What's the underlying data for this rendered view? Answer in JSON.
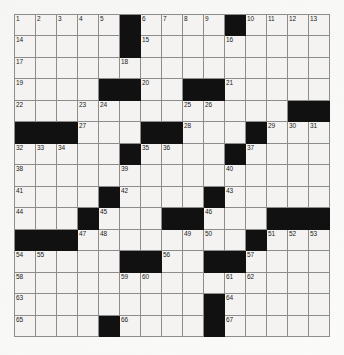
{
  "puzzle": {
    "type": "crossword-grid",
    "title": "Crossword Puzzle Grid",
    "rows": 15,
    "columns": 15,
    "colors": {
      "block": "#111111",
      "cell": "#f4f3f1",
      "grid_line": "#8d8d8d",
      "number_text": "#1b1b1b",
      "page_background": "#fbfbfa"
    },
    "black_squares": [
      [
        1,
        6
      ],
      [
        1,
        11
      ],
      [
        2,
        6
      ],
      [
        4,
        5
      ],
      [
        4,
        6
      ],
      [
        4,
        9
      ],
      [
        4,
        10
      ],
      [
        5,
        14
      ],
      [
        5,
        15
      ],
      [
        6,
        1
      ],
      [
        6,
        2
      ],
      [
        6,
        3
      ],
      [
        6,
        7
      ],
      [
        6,
        8
      ],
      [
        6,
        12
      ],
      [
        7,
        6
      ],
      [
        7,
        11
      ],
      [
        9,
        5
      ],
      [
        9,
        10
      ],
      [
        10,
        4
      ],
      [
        10,
        8
      ],
      [
        10,
        9
      ],
      [
        10,
        13
      ],
      [
        10,
        14
      ],
      [
        10,
        15
      ],
      [
        11,
        1
      ],
      [
        11,
        2
      ],
      [
        11,
        3
      ],
      [
        11,
        12
      ],
      [
        12,
        6
      ],
      [
        12,
        7
      ],
      [
        12,
        10
      ],
      [
        12,
        11
      ],
      [
        14,
        10
      ],
      [
        15,
        5
      ],
      [
        15,
        10
      ]
    ],
    "numbers": [
      {
        "row": 1,
        "col": 1,
        "n": "1"
      },
      {
        "row": 1,
        "col": 2,
        "n": "2"
      },
      {
        "row": 1,
        "col": 3,
        "n": "3"
      },
      {
        "row": 1,
        "col": 4,
        "n": "4"
      },
      {
        "row": 1,
        "col": 5,
        "n": "5"
      },
      {
        "row": 1,
        "col": 7,
        "n": "6"
      },
      {
        "row": 1,
        "col": 8,
        "n": "7"
      },
      {
        "row": 1,
        "col": 9,
        "n": "8"
      },
      {
        "row": 1,
        "col": 10,
        "n": "9"
      },
      {
        "row": 1,
        "col": 12,
        "n": "10"
      },
      {
        "row": 1,
        "col": 13,
        "n": "11"
      },
      {
        "row": 1,
        "col": 14,
        "n": "12"
      },
      {
        "row": 1,
        "col": 15,
        "n": "13"
      },
      {
        "row": 2,
        "col": 1,
        "n": "14"
      },
      {
        "row": 2,
        "col": 7,
        "n": "15"
      },
      {
        "row": 2,
        "col": 11,
        "n": "16"
      },
      {
        "row": 3,
        "col": 1,
        "n": "17"
      },
      {
        "row": 3,
        "col": 6,
        "n": "18"
      },
      {
        "row": 4,
        "col": 1,
        "n": "19"
      },
      {
        "row": 4,
        "col": 7,
        "n": "20"
      },
      {
        "row": 4,
        "col": 11,
        "n": "21"
      },
      {
        "row": 5,
        "col": 1,
        "n": "22"
      },
      {
        "row": 5,
        "col": 4,
        "n": "23"
      },
      {
        "row": 5,
        "col": 5,
        "n": "24"
      },
      {
        "row": 5,
        "col": 9,
        "n": "25"
      },
      {
        "row": 5,
        "col": 10,
        "n": "26"
      },
      {
        "row": 6,
        "col": 4,
        "n": "27"
      },
      {
        "row": 6,
        "col": 9,
        "n": "28"
      },
      {
        "row": 6,
        "col": 13,
        "n": "29"
      },
      {
        "row": 6,
        "col": 14,
        "n": "30"
      },
      {
        "row": 6,
        "col": 15,
        "n": "31"
      },
      {
        "row": 7,
        "col": 1,
        "n": "32"
      },
      {
        "row": 7,
        "col": 2,
        "n": "33"
      },
      {
        "row": 7,
        "col": 3,
        "n": "34"
      },
      {
        "row": 7,
        "col": 7,
        "n": "35"
      },
      {
        "row": 7,
        "col": 8,
        "n": "36"
      },
      {
        "row": 7,
        "col": 12,
        "n": "37"
      },
      {
        "row": 8,
        "col": 1,
        "n": "38"
      },
      {
        "row": 8,
        "col": 6,
        "n": "39"
      },
      {
        "row": 8,
        "col": 11,
        "n": "40"
      },
      {
        "row": 9,
        "col": 1,
        "n": "41"
      },
      {
        "row": 9,
        "col": 6,
        "n": "42"
      },
      {
        "row": 9,
        "col": 11,
        "n": "43"
      },
      {
        "row": 10,
        "col": 1,
        "n": "44"
      },
      {
        "row": 10,
        "col": 5,
        "n": "45"
      },
      {
        "row": 10,
        "col": 10,
        "n": "46"
      },
      {
        "row": 11,
        "col": 4,
        "n": "47"
      },
      {
        "row": 11,
        "col": 5,
        "n": "48"
      },
      {
        "row": 11,
        "col": 9,
        "n": "49"
      },
      {
        "row": 11,
        "col": 10,
        "n": "50"
      },
      {
        "row": 11,
        "col": 13,
        "n": "51"
      },
      {
        "row": 11,
        "col": 14,
        "n": "52"
      },
      {
        "row": 11,
        "col": 15,
        "n": "53"
      },
      {
        "row": 12,
        "col": 1,
        "n": "54"
      },
      {
        "row": 12,
        "col": 2,
        "n": "55"
      },
      {
        "row": 12,
        "col": 8,
        "n": "56"
      },
      {
        "row": 12,
        "col": 12,
        "n": "57"
      },
      {
        "row": 13,
        "col": 1,
        "n": "58"
      },
      {
        "row": 13,
        "col": 6,
        "n": "59"
      },
      {
        "row": 13,
        "col": 7,
        "n": "60"
      },
      {
        "row": 13,
        "col": 11,
        "n": "61"
      },
      {
        "row": 13,
        "col": 12,
        "n": "62"
      },
      {
        "row": 14,
        "col": 1,
        "n": "63"
      },
      {
        "row": 14,
        "col": 11,
        "n": "64"
      },
      {
        "row": 15,
        "col": 1,
        "n": "65"
      },
      {
        "row": 15,
        "col": 6,
        "n": "66"
      },
      {
        "row": 15,
        "col": 11,
        "n": "67"
      }
    ]
  }
}
